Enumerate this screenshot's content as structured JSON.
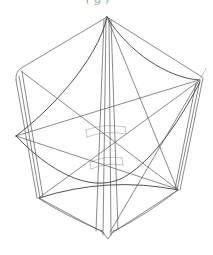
{
  "figure": {
    "type": "wireframe-line-drawing",
    "background_color": "#ffffff",
    "line_color": "#5c5c5c",
    "caption_fragment": "(g)",
    "vertices": {
      "top_apex": [
        107,
        17
      ],
      "upper_left_corner": [
        18,
        71
      ],
      "upper_right_corner": [
        201,
        78
      ],
      "left_cusp": [
        16,
        136
      ],
      "lower_left_corner": [
        39,
        198
      ],
      "lower_right_corner": [
        178,
        190
      ],
      "bottom_apex": [
        108,
        239
      ]
    },
    "strokes": [
      {
        "name": "edge-top-left",
        "w": "normal",
        "d": "M107,17 L23,67 Q15,71 16,80"
      },
      {
        "name": "edge-top-right",
        "w": "normal",
        "d": "M107,17 L202,77"
      },
      {
        "name": "left-bundle-line-1",
        "w": "normal",
        "d": "M16,80 L37,198"
      },
      {
        "name": "left-bundle-line-2",
        "w": "normal",
        "d": "M19,76 L40,198"
      },
      {
        "name": "left-bundle-line-3",
        "w": "normal",
        "d": "M22,72 L43,197"
      },
      {
        "name": "right-bundle-line-1",
        "w": "normal",
        "d": "M196,83 L175,189"
      },
      {
        "name": "right-bundle-line-2",
        "w": "normal",
        "d": "M200,80 L177,190"
      },
      {
        "name": "right-bundle-line-3",
        "w": "normal",
        "d": "M203,78 L180,190"
      },
      {
        "name": "edge-bottom-left",
        "w": "normal",
        "d": "M38,198 Q68,217 102,231"
      },
      {
        "name": "edge-bottom-right",
        "w": "normal",
        "d": "M178,190 Q146,215 114,231"
      },
      {
        "name": "bottom-apex-triangle",
        "w": "normal",
        "d": "M101,230 L108,239 L114,230"
      },
      {
        "name": "center-bundle-line-1",
        "w": "normal",
        "d": "M104,20 L96,231"
      },
      {
        "name": "center-bundle-line-2",
        "w": "normal",
        "d": "M106,19 L103,235"
      },
      {
        "name": "center-bundle-line-3",
        "w": "normal",
        "d": "M109,19 L111,235"
      },
      {
        "name": "center-bundle-line-4",
        "w": "normal",
        "d": "M111,20 L118,230"
      },
      {
        "name": "sag-curve-apex-right",
        "w": "dark",
        "d": "M107,17 C128,52 168,78 199,80"
      },
      {
        "name": "corner-hook-right",
        "w": "light",
        "d": "M199,80 Q205,72 206,68"
      },
      {
        "name": "sag-curve-apex-left",
        "w": "dark",
        "d": "M107,17 C97,62 48,112 16,136"
      },
      {
        "name": "valley-curve-cusp-to-right",
        "w": "dark",
        "d": "M16,136 C60,182 100,192 126,176 C155,158 180,120 200,82"
      },
      {
        "name": "chord-cusp-to-right-corner",
        "w": "normal",
        "d": "M16,136 L199,80"
      },
      {
        "name": "chord-cusp-to-lower-right",
        "w": "normal",
        "d": "M16,136 L177,189"
      },
      {
        "name": "chord-upper-left-to-lower-right",
        "w": "normal",
        "d": "M21,71 L177,189"
      },
      {
        "name": "chord-lower-left-to-upper-right",
        "w": "normal",
        "d": "M40,197 L199,81"
      },
      {
        "name": "chord-apex-to-lower-right",
        "w": "normal",
        "d": "M107,17 L177,189"
      },
      {
        "name": "chord-bottom-to-upper-right",
        "w": "normal",
        "d": "M110,232 L198,82"
      },
      {
        "name": "chord-lower-left-to-bottom",
        "w": "normal",
        "d": "M39,198 L104,233"
      },
      {
        "name": "chord-lower-right-to-bottom",
        "w": "normal",
        "d": "M178,190 L112,233"
      },
      {
        "name": "hump-curve-lower",
        "w": "dark",
        "d": "M39,198 Q108,176 178,190"
      },
      {
        "name": "column-band-1-top",
        "w": "light",
        "d": "M86,130 Q104,123 125,127"
      },
      {
        "name": "column-band-1-bottom",
        "w": "light",
        "d": "M87,137 Q104,130 126,134"
      },
      {
        "name": "column-band-1-left",
        "w": "light",
        "d": "M86,130 L87,137"
      },
      {
        "name": "column-band-1-right",
        "w": "light",
        "d": "M125,127 L126,134"
      },
      {
        "name": "column-band-2-top",
        "w": "light",
        "d": "M90,162 Q107,155 122,158"
      },
      {
        "name": "column-band-2-bottom",
        "w": "light",
        "d": "M91,169 Q107,162 123,165"
      },
      {
        "name": "column-band-2-left",
        "w": "light",
        "d": "M90,162 L91,169"
      },
      {
        "name": "column-band-2-right",
        "w": "light",
        "d": "M122,158 L123,165"
      }
    ]
  }
}
